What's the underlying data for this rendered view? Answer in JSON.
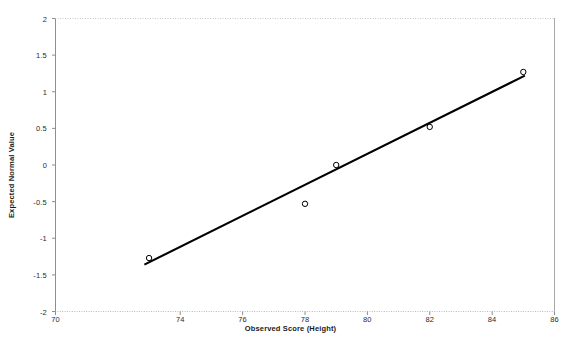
{
  "chart_data": {
    "type": "scatter",
    "title": "",
    "subtitle": "",
    "xlabel": "Observed Score (Height)",
    "ylabel": "Expected Normal Value",
    "xlim": [
      70,
      86
    ],
    "ylim": [
      -2,
      2
    ],
    "xticks": [
      70,
      74,
      76,
      78,
      80,
      82,
      84,
      86
    ],
    "xtick_labels": [
      "70",
      "74",
      "76",
      "78",
      "80",
      "82",
      "84",
      "86"
    ],
    "yticks": [
      -2,
      -1.5,
      -1,
      -0.5,
      0,
      0.5,
      1,
      1.5,
      2
    ],
    "ytick_labels": [
      "-2",
      "-1.5",
      "-1",
      "-0.5",
      "0",
      "0.5",
      "1",
      "1.5",
      "2"
    ],
    "grid": false,
    "legend": null,
    "legend_position": "none",
    "marker": "open-circle",
    "marker_color": "#000000",
    "line_color": "#000000",
    "series": [
      {
        "name": "Expected Normal Value",
        "x": [
          73,
          78,
          79,
          82,
          85
        ],
        "values": [
          -1.27,
          -0.53,
          0.0,
          0.52,
          1.27
        ]
      }
    ],
    "fit_line": {
      "name": "reference-line",
      "x": [
        72.85,
        85.05
      ],
      "y": [
        -1.36,
        1.22
      ]
    }
  },
  "axes": {
    "x_title": "Observed Score (Height)",
    "y_title": "Expected Normal Value"
  },
  "colors": {
    "frame": "#9a9a9a",
    "marker": "#000000",
    "line": "#000000",
    "text": "#222222",
    "background": "#ffffff"
  }
}
